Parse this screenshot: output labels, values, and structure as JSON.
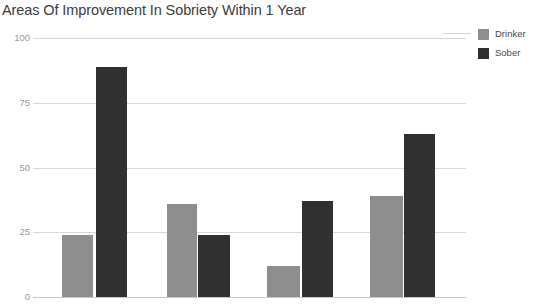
{
  "chart_data": {
    "type": "bar",
    "title": "Areas Of Improvement In Sobriety Within 1 Year",
    "xlabel": "",
    "ylabel": "",
    "ylim": [
      0,
      100
    ],
    "yticks": [
      0,
      25,
      50,
      75,
      100
    ],
    "grid": true,
    "legend_position": "right",
    "categories": [
      "Group 1",
      "Group 2",
      "Group 3",
      "Group 4"
    ],
    "series": [
      {
        "name": "Drinker",
        "color": "#8e8e8e",
        "values": [
          24,
          36,
          12,
          39
        ]
      },
      {
        "name": "Sober",
        "color": "#303030",
        "values": [
          89,
          24,
          37,
          63
        ]
      }
    ]
  },
  "axis": {
    "ticks": [
      {
        "label": "100",
        "value": 100
      },
      {
        "label": "75",
        "value": 75
      },
      {
        "label": "50",
        "value": 50
      },
      {
        "label": "25",
        "value": 25
      },
      {
        "label": "0",
        "value": 0
      }
    ]
  },
  "legend": {
    "items": [
      {
        "label": "Drinker",
        "color": "#8e8e8e"
      },
      {
        "label": "Sober",
        "color": "#2e2e2e"
      }
    ]
  }
}
